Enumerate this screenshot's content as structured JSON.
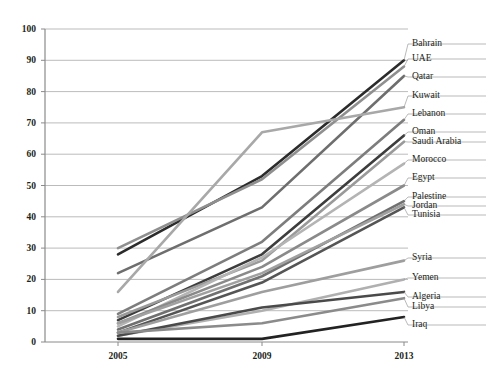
{
  "chart_data": {
    "type": "line",
    "title": "",
    "xlabel": "",
    "ylabel": "",
    "categories": [
      "2005",
      "2009",
      "2013"
    ],
    "x": [
      2005,
      2009,
      2013
    ],
    "ylim": [
      0,
      100
    ],
    "yticks": [
      0,
      10,
      20,
      30,
      40,
      50,
      60,
      70,
      80,
      90,
      100
    ],
    "grid": true,
    "legend_position": "right-of-plot-endpoints",
    "series": [
      {
        "name": "Bahrain",
        "values": [
          28,
          53,
          90
        ],
        "color": "#2b2b2b",
        "label_y": 47
      },
      {
        "name": "UAE",
        "values": [
          30,
          52,
          88
        ],
        "color": "#8f8f8f",
        "label_y": 62
      },
      {
        "name": "Qatar",
        "values": [
          22,
          43,
          85
        ],
        "color": "#6e6e6e",
        "label_y": 80
      },
      {
        "name": "Kuwait",
        "values": [
          16,
          67,
          75
        ],
        "color": "#a8a8a8",
        "label_y": 99
      },
      {
        "name": "Lebanon",
        "values": [
          9,
          32,
          71
        ],
        "color": "#7d7d7d",
        "label_y": 117
      },
      {
        "name": "Oman",
        "values": [
          7,
          28,
          66
        ],
        "color": "#3d3d3d",
        "label_y": 135
      },
      {
        "name": "Saudi Arabia",
        "values": [
          8,
          26,
          64
        ],
        "color": "#9a9a9a",
        "label_y": 145
      },
      {
        "name": "Morocco",
        "values": [
          5,
          27,
          57
        ],
        "color": "#b4b4b4",
        "label_y": 163
      },
      {
        "name": "Egypt",
        "values": [
          6,
          24,
          50
        ],
        "color": "#8a8a8a",
        "label_y": 181
      },
      {
        "name": "Palestine",
        "values": [
          4,
          21,
          45
        ],
        "color": "#707070",
        "label_y": 200
      },
      {
        "name": "Jordan",
        "values": [
          6,
          22,
          44
        ],
        "color": "#a0a0a0",
        "label_y": 209
      },
      {
        "name": "Tunisia",
        "values": [
          3,
          19,
          43
        ],
        "color": "#555555",
        "label_y": 218
      },
      {
        "name": "Syria",
        "values": [
          3,
          16,
          26
        ],
        "color": "#9e9e9e",
        "label_y": 261
      },
      {
        "name": "Yemen",
        "values": [
          2,
          10,
          20
        ],
        "color": "#b0b0b0",
        "label_y": 281
      },
      {
        "name": "Algeria",
        "values": [
          2,
          11,
          16
        ],
        "color": "#4a4a4a",
        "label_y": 300
      },
      {
        "name": "Libya",
        "values": [
          3,
          6,
          14
        ],
        "color": "#8b8b8b",
        "label_y": 310
      },
      {
        "name": "Iraq",
        "values": [
          1,
          1,
          8
        ],
        "color": "#222222",
        "label_y": 328
      }
    ]
  },
  "axis": {
    "y_labels": [
      "100",
      "90",
      "80",
      "70",
      "60",
      "50",
      "40",
      "30",
      "20",
      "10",
      "0"
    ],
    "x_labels": [
      "2005",
      "2009",
      "2013"
    ]
  },
  "caption": {
    "text": ""
  }
}
